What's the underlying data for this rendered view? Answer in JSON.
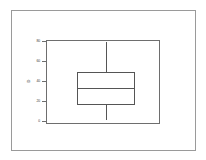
{
  "figure": {
    "background_color": "#ffffff",
    "frame_color": "#9a9a9a",
    "axis_color": "#6e6e6e",
    "glyph_color": "#555555"
  },
  "chart_data": {
    "type": "box",
    "title": "",
    "xlabel": "",
    "ylabel": "D",
    "ylim": [
      0,
      80
    ],
    "grid": false,
    "legend": false,
    "yticks": [
      80,
      60,
      40,
      20,
      0
    ],
    "ytick_labels": [
      "80",
      "60",
      "40",
      "20",
      "0"
    ],
    "categories": [
      ""
    ],
    "series": [
      {
        "name": "",
        "whisker_low": 3,
        "q1": 20,
        "median": 41,
        "q3": 58,
        "whisker_high": 78,
        "outliers": []
      }
    ]
  },
  "geometry": {
    "outer_frame": {
      "x": 11,
      "y": 10,
      "w": 185,
      "h": 141
    },
    "plot_frame": {
      "x": 46,
      "y": 40,
      "w": 114,
      "h": 84
    },
    "tick_y_positions": [
      41,
      61,
      81,
      101,
      121
    ],
    "box": {
      "left": 77,
      "right": 135,
      "top": 72,
      "bottom": 105
    },
    "median_y": 88,
    "whisker_x": 106,
    "whisker_top_y": 42,
    "whisker_bottom_y": 120
  }
}
